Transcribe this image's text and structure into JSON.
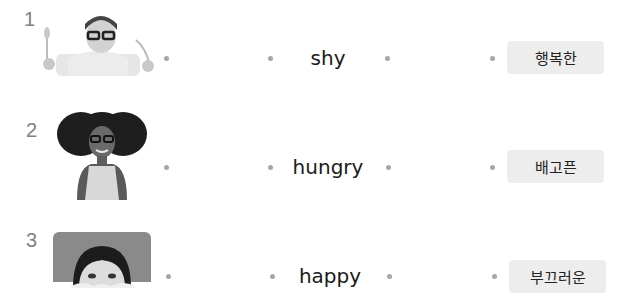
{
  "exercise": {
    "rows": [
      {
        "number": "1",
        "photo": "child-with-fork-and-glasses-photo",
        "word": "shy",
        "korean": "행복한"
      },
      {
        "number": "2",
        "photo": "girl-with-curly-hair-photo",
        "word": "hungry",
        "korean": "배고픈"
      },
      {
        "number": "3",
        "photo": "child-peeking-photo",
        "word": "happy",
        "korean": "부끄러운"
      }
    ],
    "colors": {
      "dot": "#a6a6a6",
      "number": "#808080",
      "answer_box": "#ededed",
      "word": "#1a1a1a"
    }
  }
}
